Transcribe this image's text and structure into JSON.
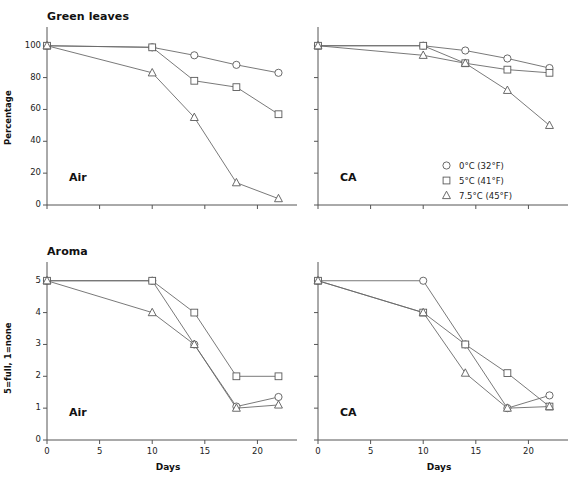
{
  "figure": {
    "rows": [
      "Green leaves",
      "Aroma"
    ],
    "columns": [
      "Air",
      "CA"
    ],
    "x_axis_label": "Days",
    "x_ticks": [
      "0",
      "5",
      "10",
      "15",
      "20"
    ],
    "y_label_top": "Percentage",
    "y_label_bottom": "5=full, 1=none",
    "y_ticks_top": [
      "0",
      "20",
      "40",
      "60",
      "80",
      "100"
    ],
    "y_ticks_bottom": [
      "0",
      "1",
      "2",
      "3",
      "4",
      "5"
    ]
  },
  "legend": {
    "position": "top-right-panel",
    "items": [
      {
        "marker": "circle-marker",
        "label": "0°C (32°F)"
      },
      {
        "marker": "square-marker",
        "label": "5°C (41°F)"
      },
      {
        "marker": "triangle-marker",
        "label": "7.5°C (45°F)"
      }
    ]
  },
  "panels": {
    "tl": {
      "title": "Green leaves",
      "tag": "Air"
    },
    "tr": {
      "title": "",
      "tag": "CA"
    },
    "bl": {
      "title": "Aroma",
      "tag": "Air"
    },
    "br": {
      "title": "",
      "tag": "CA"
    }
  },
  "chart_data": [
    {
      "id": "green-leaves-air",
      "type": "line",
      "title": "Green leaves",
      "annotation": "Air",
      "xlabel": "Days",
      "ylabel": "Percentage",
      "xlim": [
        0,
        23
      ],
      "ylim": [
        0,
        108
      ],
      "xticks": [
        0,
        5,
        10,
        15,
        20
      ],
      "yticks": [
        0,
        20,
        40,
        60,
        80,
        100
      ],
      "grid": false,
      "x": [
        0,
        10,
        14,
        18,
        22
      ],
      "series": [
        {
          "name": "0°C (32°F)",
          "marker": "circle",
          "values": [
            100,
            99,
            94,
            88,
            83
          ]
        },
        {
          "name": "5°C (41°F)",
          "marker": "square",
          "values": [
            100,
            99,
            78,
            74,
            57
          ]
        },
        {
          "name": "7.5°C (45°F)",
          "marker": "triangle",
          "values": [
            100,
            83,
            55,
            14,
            4
          ]
        }
      ]
    },
    {
      "id": "green-leaves-ca",
      "type": "line",
      "title": "",
      "annotation": "CA",
      "xlabel": "Days",
      "ylabel": "Percentage",
      "xlim": [
        0,
        23
      ],
      "ylim": [
        0,
        108
      ],
      "xticks": [
        0,
        5,
        10,
        15,
        20
      ],
      "yticks": [
        0,
        20,
        40,
        60,
        80,
        100
      ],
      "grid": false,
      "x": [
        0,
        10,
        14,
        18,
        22
      ],
      "series": [
        {
          "name": "0°C (32°F)",
          "marker": "circle",
          "values": [
            100,
            100,
            97,
            92,
            86
          ]
        },
        {
          "name": "5°C (41°F)",
          "marker": "square",
          "values": [
            100,
            100,
            89,
            85,
            83
          ]
        },
        {
          "name": "7.5°C (45°F)",
          "marker": "triangle",
          "values": [
            100,
            94,
            89,
            72,
            50
          ]
        }
      ]
    },
    {
      "id": "aroma-air",
      "type": "line",
      "title": "Aroma",
      "annotation": "Air",
      "xlabel": "Days",
      "ylabel": "5=full, 1=none",
      "xlim": [
        0,
        23
      ],
      "ylim": [
        0,
        5.4
      ],
      "xticks": [
        0,
        5,
        10,
        15,
        20
      ],
      "yticks": [
        0,
        1,
        2,
        3,
        4,
        5
      ],
      "grid": false,
      "x": [
        0,
        10,
        14,
        18,
        22
      ],
      "series": [
        {
          "name": "0°C (32°F)",
          "marker": "circle",
          "values": [
            5,
            5,
            3,
            1.05,
            1.35
          ]
        },
        {
          "name": "5°C (41°F)",
          "marker": "square",
          "values": [
            5,
            5,
            4,
            2,
            2
          ]
        },
        {
          "name": "7.5°C (45°F)",
          "marker": "triangle",
          "values": [
            5,
            4,
            3,
            1,
            1.1
          ]
        }
      ]
    },
    {
      "id": "aroma-ca",
      "type": "line",
      "title": "",
      "annotation": "CA",
      "xlabel": "Days",
      "ylabel": "5=full, 1=none",
      "xlim": [
        0,
        23
      ],
      "ylim": [
        0,
        5.4
      ],
      "xticks": [
        0,
        5,
        10,
        15,
        20
      ],
      "yticks": [
        0,
        1,
        2,
        3,
        4,
        5
      ],
      "grid": false,
      "x": [
        0,
        10,
        14,
        18,
        22
      ],
      "series": [
        {
          "name": "0°C (32°F)",
          "marker": "circle",
          "values": [
            5,
            5,
            3,
            1,
            1.4
          ]
        },
        {
          "name": "5°C (41°F)",
          "marker": "square",
          "values": [
            5,
            4,
            3,
            2.1,
            1.05
          ]
        },
        {
          "name": "7.5°C (45°F)",
          "marker": "triangle",
          "values": [
            5,
            4,
            2.1,
            1,
            1.05
          ]
        }
      ]
    }
  ]
}
